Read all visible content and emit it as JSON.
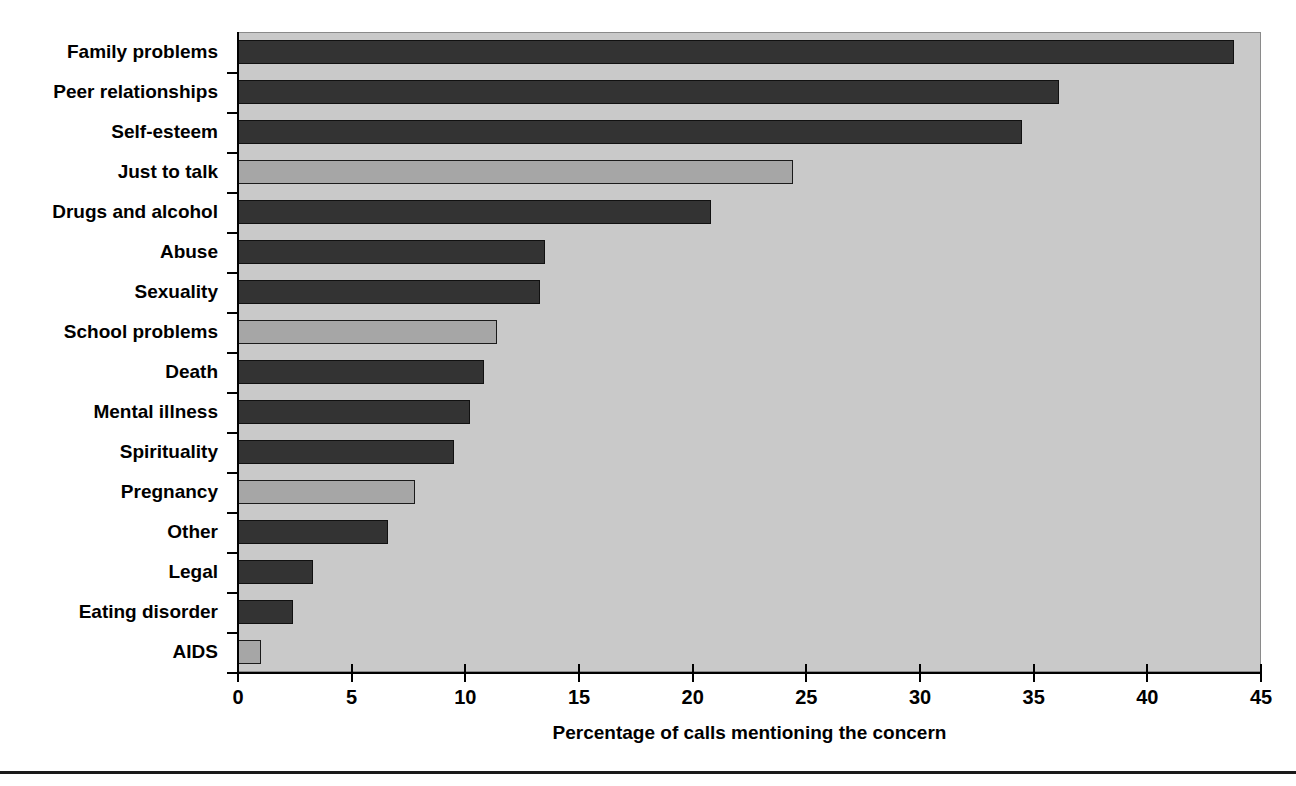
{
  "chart_data": {
    "type": "bar",
    "orientation": "horizontal",
    "title": "",
    "xlabel": "Percentage of calls mentioning the concern",
    "ylabel": "",
    "xlim": [
      0,
      45
    ],
    "xticks": [
      0,
      5,
      10,
      15,
      20,
      25,
      30,
      35,
      40,
      45
    ],
    "xtick_labels": [
      "0",
      "5",
      "10",
      "15",
      "20",
      "25",
      "30",
      "35",
      "40",
      "45"
    ],
    "grid": false,
    "legend": "none",
    "plot_background": "#c9c9c9",
    "bar_colors": {
      "dark": "#333333",
      "light": "#a6a6a6"
    },
    "categories": [
      "Family problems",
      "Peer relationships",
      "Self-esteem",
      "Just to talk",
      "Drugs and alcohol",
      "Abuse",
      "Sexuality",
      "School problems",
      "Death",
      "Mental illness",
      "Spirituality",
      "Pregnancy",
      "Other",
      "Legal",
      "Eating disorder",
      "AIDS"
    ],
    "values": [
      43.8,
      36.1,
      34.5,
      24.4,
      20.8,
      13.5,
      13.3,
      11.4,
      10.8,
      10.2,
      9.5,
      7.8,
      6.6,
      3.3,
      2.4,
      1.0
    ],
    "shades": [
      "dark",
      "dark",
      "dark",
      "light",
      "dark",
      "dark",
      "dark",
      "light",
      "dark",
      "dark",
      "dark",
      "light",
      "dark",
      "dark",
      "dark",
      "light"
    ]
  }
}
